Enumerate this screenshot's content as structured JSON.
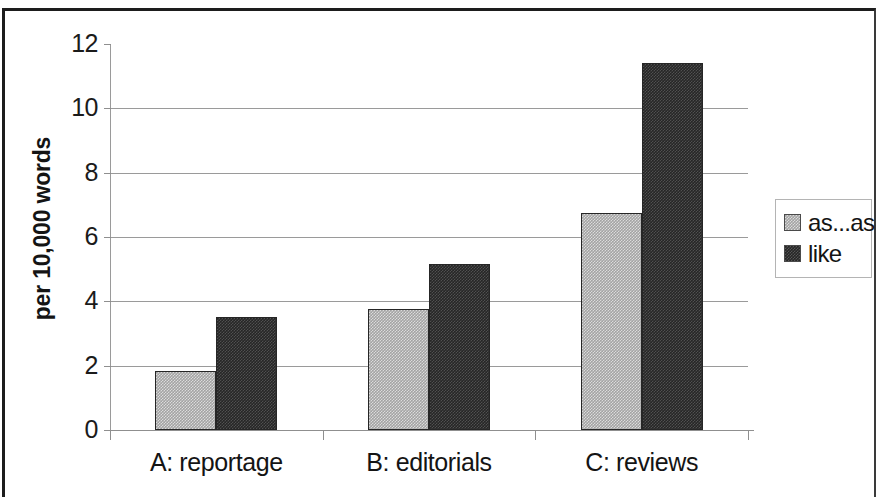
{
  "chart_data": {
    "type": "bar",
    "title": "",
    "subtitle": "",
    "xlabel": "",
    "ylabel": "per 10,000 words",
    "categories": [
      "A: reportage",
      "B: editorials",
      "C: reviews"
    ],
    "series": [
      {
        "name": "as...as",
        "color": "#a3a3a3",
        "values": [
          1.85,
          3.75,
          6.75
        ]
      },
      {
        "name": "like",
        "color": "#262626",
        "values": [
          3.5,
          5.15,
          11.4
        ]
      }
    ],
    "ylim": [
      0,
      12
    ],
    "ytick_labels": [
      "12",
      "10",
      "8",
      "6",
      "4",
      "2",
      "0"
    ],
    "ytick_values": [
      12,
      10,
      8,
      6,
      4,
      2,
      0
    ],
    "grid": "horizontal",
    "legend_position": "right"
  },
  "legend": {
    "entries": [
      {
        "label": "as...as"
      },
      {
        "label": "like"
      }
    ]
  },
  "axes": {
    "y_title": "per 10,000 words"
  }
}
